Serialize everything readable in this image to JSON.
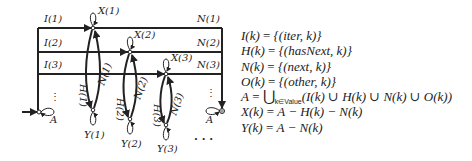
{
  "diagram": {
    "row_labels_left": [
      "I(1)",
      "I(2)",
      "I(3)"
    ],
    "row_labels_right": [
      "N(1)",
      "N(2)",
      "N(3)"
    ],
    "top_nodes": [
      "X(1)",
      "X(2)",
      "X(3)"
    ],
    "bottom_nodes": [
      "Y(1)",
      "Y(2)",
      "Y(3)"
    ],
    "edge_labels_h": [
      "H(1)",
      "H(2)",
      "H(3)"
    ],
    "edge_labels_n": [
      "N(1)",
      "N(2)",
      "N(3)"
    ],
    "start_node_label": "A",
    "end_node_label": "A",
    "ellipsis_vertical": "⋮",
    "ellipsis_diagonal": ". . ."
  },
  "equations": [
    {
      "lhs": "I(k)",
      "rhs": "{(iter, k)}"
    },
    {
      "lhs": "H(k)",
      "rhs": "{(hasNext, k)}"
    },
    {
      "lhs": "N(k)",
      "rhs": "{(next, k)}"
    },
    {
      "lhs": "O(k)",
      "rhs": "{(other, k)}"
    },
    {
      "lhs": "A",
      "union": "⋃",
      "subscript": "k∈Value",
      "rhs": "(I(k) ∪ H(k) ∪ N(k) ∪ O(k))"
    },
    {
      "lhs": "X(k)",
      "rhs": "A − H(k) − N(k)"
    },
    {
      "lhs": "Y(k)",
      "rhs": "A − N(k)"
    }
  ],
  "equals_sign": "="
}
